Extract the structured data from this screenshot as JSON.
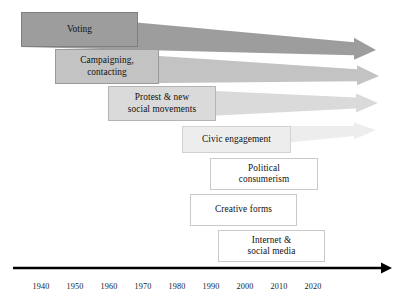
{
  "figure": {
    "type": "timeline-diagram",
    "title": ""
  },
  "colors": {
    "band_voting": "#9d9d9d",
    "band_campaigning": "#c3c3c3",
    "band_protest": "#dadada",
    "band_civic": "#ededed",
    "box_border_dark": "#7f7f7f",
    "box_border_light": "#c9c9c9",
    "box_fill_white": "#ffffff",
    "axis": "#000000",
    "text": "#111111"
  },
  "modes": [
    {
      "id": "voting",
      "label": "Voting",
      "label_lines": "Voting",
      "box": {
        "x": 21,
        "y": 12,
        "w": 117,
        "h": 35
      },
      "fill": "#9d9d9d",
      "border": "#7f7f7f",
      "band": {
        "tip_x": 376,
        "tip_y": 50,
        "end_half_h": 11,
        "shaft_half_h": 6.5
      }
    },
    {
      "id": "campaigning-contacting",
      "label": "Campaigning, contacting",
      "label_lines": "Campaigning,\ncontacting",
      "box": {
        "x": 55,
        "y": 49,
        "w": 104,
        "h": 35
      },
      "fill": "#c3c3c3",
      "border": "#9a9a9a",
      "band": {
        "tip_x": 379,
        "tip_y": 76,
        "end_half_h": 10,
        "shaft_half_h": 6
      }
    },
    {
      "id": "protest-new-social-movements",
      "label": "Protest & new social movements",
      "label_lines": "Protest & new\nsocial movements",
      "box": {
        "x": 108,
        "y": 86,
        "w": 108,
        "h": 35
      },
      "fill": "#dadada",
      "border": "#b4b4b4",
      "band": {
        "tip_x": 378,
        "tip_y": 103,
        "end_half_h": 9.5,
        "shaft_half_h": 5.5
      }
    },
    {
      "id": "civic-engagement",
      "label": "Civic engagement",
      "label_lines": "Civic engagement",
      "box": {
        "x": 182,
        "y": 126,
        "w": 109,
        "h": 27
      },
      "fill": "#ededed",
      "border": "#d2d2d2",
      "band": {
        "tip_x": 376,
        "tip_y": 130,
        "end_half_h": 8.5,
        "shaft_half_h": 5
      }
    },
    {
      "id": "political-consumerism",
      "label": "Political consumerism",
      "label_lines": "Political\nconsumerism",
      "box": {
        "x": 210,
        "y": 158,
        "w": 108,
        "h": 32
      },
      "fill": "#ffffff",
      "border": "#c9c9c9",
      "band": null
    },
    {
      "id": "creative-forms",
      "label": "Creative forms",
      "label_lines": "Creative forms",
      "box": {
        "x": 190,
        "y": 194,
        "w": 107,
        "h": 32
      },
      "fill": "#ffffff",
      "border": "#c9c9c9",
      "band": null
    },
    {
      "id": "internet-social-media",
      "label": "Internet & social media",
      "label_lines": "Internet &\nsocial media",
      "box": {
        "x": 218,
        "y": 230,
        "w": 107,
        "h": 32
      },
      "fill": "#ffffff",
      "border": "#c9c9c9",
      "band": null
    }
  ],
  "axis": {
    "line": {
      "x1": 13,
      "x2": 392,
      "y": 268,
      "thickness": 2.4
    },
    "arrowhead": true,
    "label_y": 282,
    "years": [
      {
        "label": "1940",
        "x": 41
      },
      {
        "label": "1950",
        "x": 75
      },
      {
        "label": "1960",
        "x": 109
      },
      {
        "label": "1970",
        "x": 143
      },
      {
        "label": "1980",
        "x": 177
      },
      {
        "label": "1990",
        "x": 211
      },
      {
        "label": "2000",
        "x": 245
      },
      {
        "label": "2010",
        "x": 279
      },
      {
        "label": "2020",
        "x": 313
      }
    ]
  }
}
